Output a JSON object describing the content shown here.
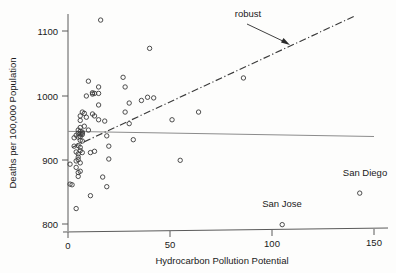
{
  "chart_data": {
    "type": "scatter",
    "title": "",
    "xlabel": "Hydrocarbon Pollution Potential",
    "ylabel": "Deaths per 100,000 Population",
    "xlim": [
      -3,
      152
    ],
    "ylim": [
      780,
      1140
    ],
    "xticks": [
      0,
      50,
      100,
      150
    ],
    "yticks": [
      800,
      900,
      1000,
      1100
    ],
    "xtick_labels": [
      "0",
      "50",
      "100",
      "150"
    ],
    "ytick_labels": [
      "800",
      "900",
      "1000",
      "1100"
    ],
    "grid": false,
    "legend": "none",
    "points": [
      {
        "x": 1,
        "y": 893
      },
      {
        "x": 1,
        "y": 862
      },
      {
        "x": 2,
        "y": 861
      },
      {
        "x": 3,
        "y": 921
      },
      {
        "x": 3,
        "y": 934
      },
      {
        "x": 4,
        "y": 938
      },
      {
        "x": 4,
        "y": 912
      },
      {
        "x": 4,
        "y": 898
      },
      {
        "x": 4,
        "y": 888
      },
      {
        "x": 4,
        "y": 824
      },
      {
        "x": 5,
        "y": 946
      },
      {
        "x": 5,
        "y": 941
      },
      {
        "x": 5,
        "y": 935
      },
      {
        "x": 5,
        "y": 922
      },
      {
        "x": 5,
        "y": 909
      },
      {
        "x": 5,
        "y": 904
      },
      {
        "x": 5,
        "y": 900
      },
      {
        "x": 5,
        "y": 880
      },
      {
        "x": 5,
        "y": 874
      },
      {
        "x": 6,
        "y": 968
      },
      {
        "x": 6,
        "y": 961
      },
      {
        "x": 6,
        "y": 950
      },
      {
        "x": 6,
        "y": 944
      },
      {
        "x": 6,
        "y": 940
      },
      {
        "x": 6,
        "y": 936
      },
      {
        "x": 6,
        "y": 930
      },
      {
        "x": 6,
        "y": 919
      },
      {
        "x": 6,
        "y": 914
      },
      {
        "x": 6,
        "y": 895
      },
      {
        "x": 6,
        "y": 882
      },
      {
        "x": 7,
        "y": 974
      },
      {
        "x": 7,
        "y": 943
      },
      {
        "x": 7,
        "y": 941
      },
      {
        "x": 7,
        "y": 939
      },
      {
        "x": 7,
        "y": 929
      },
      {
        "x": 7,
        "y": 911
      },
      {
        "x": 8,
        "y": 972
      },
      {
        "x": 8,
        "y": 952
      },
      {
        "x": 9,
        "y": 999
      },
      {
        "x": 9,
        "y": 966
      },
      {
        "x": 10,
        "y": 1022
      },
      {
        "x": 10,
        "y": 946
      },
      {
        "x": 11,
        "y": 911
      },
      {
        "x": 11,
        "y": 844
      },
      {
        "x": 12,
        "y": 1004
      },
      {
        "x": 12,
        "y": 1002
      },
      {
        "x": 12,
        "y": 971
      },
      {
        "x": 13,
        "y": 1003
      },
      {
        "x": 13,
        "y": 968
      },
      {
        "x": 13,
        "y": 913
      },
      {
        "x": 15,
        "y": 1013
      },
      {
        "x": 15,
        "y": 1003
      },
      {
        "x": 15,
        "y": 985
      },
      {
        "x": 15,
        "y": 962
      },
      {
        "x": 16,
        "y": 1117
      },
      {
        "x": 17,
        "y": 873
      },
      {
        "x": 18,
        "y": 960
      },
      {
        "x": 19,
        "y": 937
      },
      {
        "x": 19,
        "y": 858
      },
      {
        "x": 20,
        "y": 921
      },
      {
        "x": 20,
        "y": 901
      },
      {
        "x": 27,
        "y": 1028
      },
      {
        "x": 28,
        "y": 1013
      },
      {
        "x": 28,
        "y": 974
      },
      {
        "x": 30,
        "y": 988
      },
      {
        "x": 30,
        "y": 956
      },
      {
        "x": 32,
        "y": 931
      },
      {
        "x": 36,
        "y": 992
      },
      {
        "x": 39,
        "y": 997
      },
      {
        "x": 40,
        "y": 1073
      },
      {
        "x": 42,
        "y": 996
      },
      {
        "x": 51,
        "y": 962
      },
      {
        "x": 55,
        "y": 899
      },
      {
        "x": 64,
        "y": 974
      },
      {
        "x": 86,
        "y": 1027
      },
      {
        "x": 105,
        "y": 799
      },
      {
        "x": 143,
        "y": 848
      }
    ],
    "lines": [
      {
        "name": "least-squares",
        "style": "solid",
        "color": "#8c8c8c",
        "x0": 0,
        "y0": 944,
        "x1": 150,
        "y1": 936
      },
      {
        "name": "robust",
        "style": "dash-dot",
        "color": "#3a3a3a",
        "x0": 2,
        "y0": 919,
        "x1": 141,
        "y1": 1124
      }
    ],
    "annotations": [
      {
        "name": "robust-label",
        "text": "robust",
        "x": 55,
        "y": 1133
      },
      {
        "name": "san-diego-label",
        "text": "San Diego",
        "x": 135,
        "y": 879
      },
      {
        "name": "san-jose-label",
        "text": "San Jose",
        "x": 99,
        "y": 826
      }
    ]
  },
  "axes": {
    "x_title": "Hydrocarbon Pollution Potential",
    "y_title": "Deaths per 100,000 Population",
    "x_ticks": [
      "0",
      "50",
      "100",
      "150"
    ],
    "y_ticks": [
      "1100",
      "1000",
      "900",
      "800"
    ]
  },
  "labels": {
    "robust": "robust",
    "san_diego": "San Diego",
    "san_jose": "San Jose"
  }
}
